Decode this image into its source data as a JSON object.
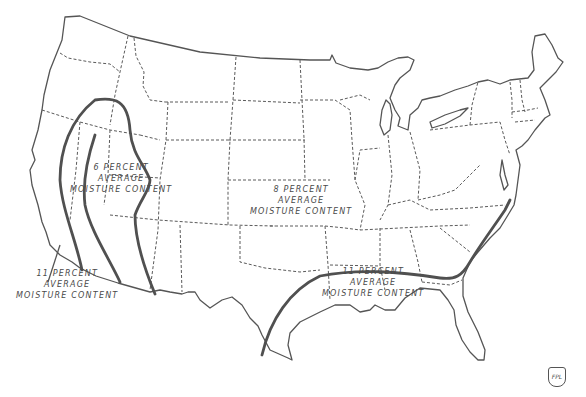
{
  "map": {
    "subject": "United States average wood moisture content zones",
    "zones": [
      {
        "id": "pacific-coast",
        "lines": [
          "11 PERCENT",
          "AVERAGE",
          "MOISTURE CONTENT"
        ]
      },
      {
        "id": "southwest-interior",
        "lines": [
          "6 PERCENT",
          "AVERAGE",
          "MOISTURE CONTENT"
        ]
      },
      {
        "id": "central-north",
        "lines": [
          "8 PERCENT",
          "AVERAGE",
          "MOISTURE CONTENT"
        ]
      },
      {
        "id": "gulf-southeast",
        "lines": [
          "11 PERCENT",
          "AVERAGE",
          "MOISTURE CONTENT"
        ]
      }
    ],
    "logo": "FPL",
    "colors": {
      "background": "#ffffff",
      "line": "#555555",
      "text": "#4a4a4a"
    }
  }
}
